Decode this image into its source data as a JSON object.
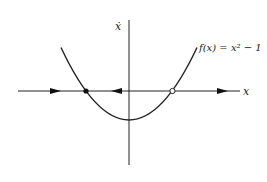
{
  "diagram": {
    "type": "phase-line",
    "x_axis_label": "x",
    "y_axis_label": "ẋ",
    "function_label": "f(x) = x² − 1",
    "function": {
      "expression": "x^2 - 1",
      "vertex": [
        0,
        -1
      ],
      "roots": [
        -1,
        1
      ]
    },
    "fixed_points": [
      {
        "x": -1,
        "stability": "stable",
        "marker": "filled"
      },
      {
        "x": 1,
        "stability": "unstable",
        "marker": "open"
      }
    ],
    "flow_arrows": [
      {
        "region": "x < -1",
        "direction": "right"
      },
      {
        "region": "-1 < x < 1",
        "direction": "left"
      },
      {
        "region": "x > 1",
        "direction": "right"
      }
    ],
    "colors": {
      "stroke": "#222222",
      "background": "#ffffff"
    }
  }
}
